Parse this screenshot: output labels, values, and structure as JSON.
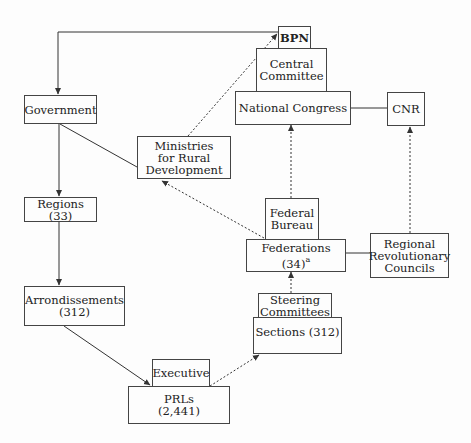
{
  "diagram": {
    "nodes": {
      "bpn": {
        "label": "BPN"
      },
      "central_committee": {
        "label": "Central\nCommittee"
      },
      "national_congress": {
        "label": "National Congress"
      },
      "cnr": {
        "label": "CNR"
      },
      "government": {
        "label": "Government"
      },
      "ministries": {
        "label": "Ministries\nfor Rural\nDevelopment"
      },
      "regions": {
        "label": "Regions (33)"
      },
      "federal_bureau": {
        "label": "Federal\nBureau"
      },
      "federations": {
        "label": "Federations (34)",
        "superscript": "a"
      },
      "regional_councils": {
        "label": "Regional\nRevolutionary\nCouncils"
      },
      "arrondissements": {
        "label": "Arrondissements\n(312)"
      },
      "steering_committees": {
        "label": "Steering\nCommittees"
      },
      "sections": {
        "label": "Sections (312)"
      },
      "executive": {
        "label": "Executive"
      },
      "prls": {
        "label": "PRLs\n(2,441)"
      }
    },
    "edges": [
      {
        "from": "bpn",
        "to": "government",
        "style": "solid",
        "arrow": "to"
      },
      {
        "from": "government",
        "to": "regions",
        "style": "solid",
        "arrow": "to"
      },
      {
        "from": "regions",
        "to": "arrondissements",
        "style": "solid",
        "arrow": "to"
      },
      {
        "from": "arrondissements",
        "to": "prls",
        "style": "solid",
        "arrow": "to"
      },
      {
        "from": "government",
        "to": "ministries",
        "style": "solid",
        "arrow": "none"
      },
      {
        "from": "ministries",
        "to": "bpn",
        "style": "dashed",
        "arrow": "to"
      },
      {
        "from": "federations",
        "to": "ministries",
        "style": "dashed",
        "arrow": "to"
      },
      {
        "from": "federations",
        "to": "national_congress",
        "style": "dashed",
        "arrow": "to"
      },
      {
        "from": "national_congress",
        "to": "cnr",
        "style": "solid",
        "arrow": "none"
      },
      {
        "from": "regional_councils",
        "to": "cnr",
        "style": "dashed",
        "arrow": "to"
      },
      {
        "from": "federations",
        "to": "regional_councils",
        "style": "solid",
        "arrow": "none"
      },
      {
        "from": "sections",
        "to": "federations",
        "style": "dashed",
        "arrow": "to"
      },
      {
        "from": "prls",
        "to": "sections",
        "style": "dashed",
        "arrow": "to"
      }
    ]
  }
}
